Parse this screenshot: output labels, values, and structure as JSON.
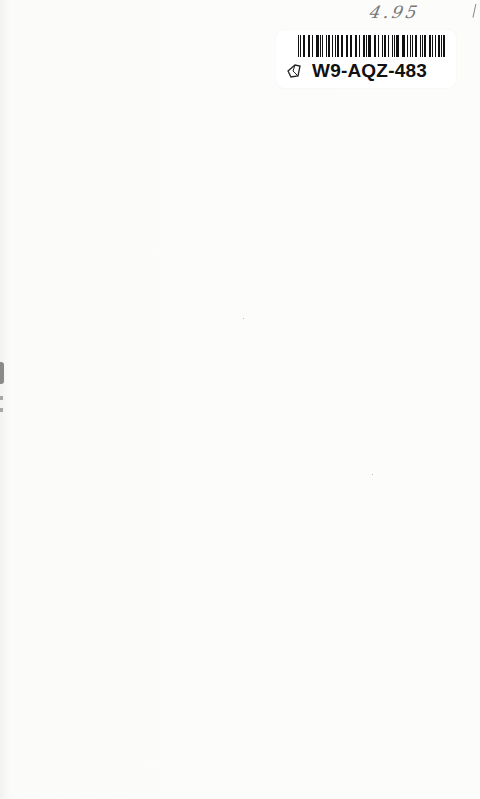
{
  "page": {
    "type": "blank book endpaper",
    "background_color": "#fbfbfa"
  },
  "handwritten_price": "4.95",
  "sticker": {
    "barcode_icon": "barcode-icon",
    "tag_icon": "tag-icon",
    "code": "W9-AQZ-483"
  }
}
